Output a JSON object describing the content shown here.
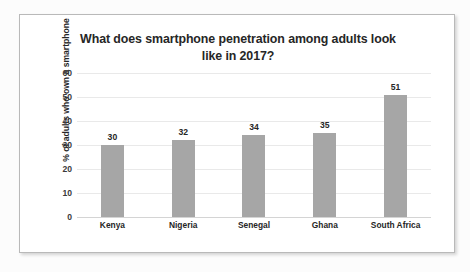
{
  "chart_data": {
    "type": "bar",
    "title": "What does smartphone penetration among adults look like in 2017?",
    "title_line1": "What does smartphone penetration among adults look",
    "title_line2": "like in 2017?",
    "xlabel": "",
    "ylabel": "% of adults who own a smartphone",
    "categories": [
      "Kenya",
      "Nigeria",
      "Senegal",
      "Ghana",
      "South Africa"
    ],
    "values": [
      30,
      32,
      34,
      35,
      51
    ],
    "value_labels": [
      "30",
      "32",
      "34",
      "35",
      "51"
    ],
    "ylim": [
      0,
      60
    ],
    "ytick_values": [
      60,
      50,
      40,
      30,
      20,
      10,
      0
    ],
    "ytick_labels": [
      "60",
      "50",
      "40",
      "30",
      "20",
      "10",
      "0"
    ],
    "grid": true,
    "legend": false,
    "bar_color": "#a6a6a6",
    "gridline_color": "#e9e9e9",
    "text_color": "#262626",
    "plot_background": "#ffffff",
    "frame_border_color": "#b9b9b9"
  }
}
